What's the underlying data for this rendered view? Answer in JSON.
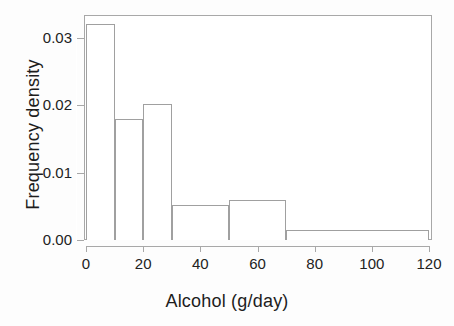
{
  "chart_data": {
    "type": "bar",
    "title": "",
    "subtitle": "",
    "xlabel": "Alcohol (g/day)",
    "ylabel": "Frequency density",
    "xlim": [
      0,
      120
    ],
    "ylim": [
      0,
      0.0335
    ],
    "grid": false,
    "legend": null,
    "bin_edges": [
      0,
      10,
      20,
      30,
      50,
      70,
      120
    ],
    "categories": [
      "0-10",
      "10-20",
      "20-30",
      "30-50",
      "50-70",
      "70-120"
    ],
    "values": [
      0.032,
      0.018,
      0.0201,
      0.0052,
      0.006,
      0.0015
    ],
    "bars": [
      {
        "label": "0-10",
        "x0": 0,
        "x1": 10,
        "density": 0.032
      },
      {
        "label": "10-20",
        "x0": 10,
        "x1": 20,
        "density": 0.018
      },
      {
        "label": "20-30",
        "x0": 20,
        "x1": 30,
        "density": 0.0201
      },
      {
        "label": "30-50",
        "x0": 30,
        "x1": 50,
        "density": 0.0052
      },
      {
        "label": "50-70",
        "x0": 50,
        "x1": 70,
        "density": 0.006
      },
      {
        "label": "70-120",
        "x0": 70,
        "x1": 120,
        "density": 0.0015
      }
    ],
    "xticks": [
      0,
      20,
      40,
      60,
      80,
      100,
      120
    ],
    "xtick_labels": [
      "0",
      "20",
      "40",
      "60",
      "80",
      "100",
      "120"
    ],
    "yticks": [
      0.0,
      0.01,
      0.02,
      0.03
    ],
    "ytick_labels": [
      "0.00",
      "0.01",
      "0.02",
      "0.03"
    ]
  },
  "colors": {
    "bar_fill": "#ffffff",
    "bar_stroke": "#a0a0a0",
    "axis": "#a8a8a8",
    "text": "#1d1d1d",
    "background": "#fdfdfd"
  }
}
